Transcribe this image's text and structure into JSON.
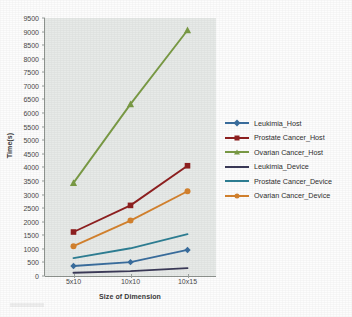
{
  "chart_data": {
    "type": "line",
    "title": "",
    "xlabel": "Size of Dimension",
    "ylabel": "Time(s)",
    "categories": [
      "5x10",
      "10x10",
      "10x15"
    ],
    "ylim": [
      0,
      9500
    ],
    "ytick_step": 500,
    "yticks": [
      0,
      500,
      1000,
      1500,
      2000,
      2500,
      3000,
      3500,
      4000,
      4500,
      5000,
      5500,
      6000,
      6500,
      7000,
      7500,
      8000,
      8500,
      9000,
      9500
    ],
    "grid": false,
    "legend_position": "right",
    "plot_background": "#e7eae8",
    "series": [
      {
        "name": "Leukimia_Host",
        "color": "#3a6e9e",
        "marker": "diamond",
        "values": [
          370,
          510,
          960
        ]
      },
      {
        "name": "Prostate Cancer_Host",
        "color": "#8f2020",
        "marker": "square",
        "values": [
          1620,
          2600,
          4060
        ]
      },
      {
        "name": "Ovarian Cancer_Host",
        "color": "#7a9b45",
        "marker": "triangle",
        "values": [
          3430,
          6330,
          9050
        ]
      },
      {
        "name": "Leukimia_Device",
        "color": "#3b3a58",
        "marker": "line",
        "values": [
          120,
          180,
          290
        ]
      },
      {
        "name": "Prostate Cancer_Device",
        "color": "#2e7f94",
        "marker": "line",
        "values": [
          660,
          1020,
          1540
        ]
      },
      {
        "name": "Ovarian Cancer_Device",
        "color": "#d4822e",
        "marker": "circle",
        "values": [
          1100,
          2040,
          3120
        ]
      }
    ]
  }
}
